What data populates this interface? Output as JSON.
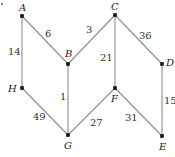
{
  "graph": {
    "nodes": [
      {
        "id": "A",
        "label": "A",
        "x": 22,
        "y": 16,
        "lx": 19,
        "ly": 11
      },
      {
        "id": "B",
        "label": "B",
        "x": 68,
        "y": 64,
        "lx": 65,
        "ly": 57
      },
      {
        "id": "C",
        "label": "C",
        "x": 115,
        "y": 15,
        "lx": 111,
        "ly": 10
      },
      {
        "id": "D",
        "label": "D",
        "x": 162,
        "y": 64,
        "lx": 166,
        "ly": 66
      },
      {
        "id": "H",
        "label": "H",
        "x": 22,
        "y": 88,
        "lx": 8,
        "ly": 92
      },
      {
        "id": "G",
        "label": "G",
        "x": 68,
        "y": 135,
        "lx": 64,
        "ly": 149
      },
      {
        "id": "F",
        "label": "F",
        "x": 115,
        "y": 88,
        "lx": 111,
        "ly": 102
      },
      {
        "id": "E",
        "label": "E",
        "x": 162,
        "y": 136,
        "lx": 159,
        "ly": 150
      }
    ],
    "edges": [
      {
        "from": "A",
        "to": "B",
        "weight": "6",
        "wx": 45,
        "wy": 37
      },
      {
        "from": "A",
        "to": "H",
        "weight": "14",
        "wx": 8,
        "wy": 55
      },
      {
        "from": "B",
        "to": "C",
        "weight": "3",
        "wx": 86,
        "wy": 33
      },
      {
        "from": "B",
        "to": "G",
        "weight": "1",
        "wx": 60,
        "wy": 100
      },
      {
        "from": "C",
        "to": "D",
        "weight": "36",
        "wx": 139,
        "wy": 39
      },
      {
        "from": "C",
        "to": "F",
        "weight": "21",
        "wx": 100,
        "wy": 61
      },
      {
        "from": "D",
        "to": "E",
        "weight": "15",
        "wx": 164,
        "wy": 104
      },
      {
        "from": "H",
        "to": "G",
        "weight": "49",
        "wx": 33,
        "wy": 120
      },
      {
        "from": "G",
        "to": "F",
        "weight": "27",
        "wx": 90,
        "wy": 126
      },
      {
        "from": "F",
        "to": "E",
        "weight": "31",
        "wx": 125,
        "wy": 121
      }
    ]
  },
  "marker": {
    "x": 2,
    "y": 4
  }
}
